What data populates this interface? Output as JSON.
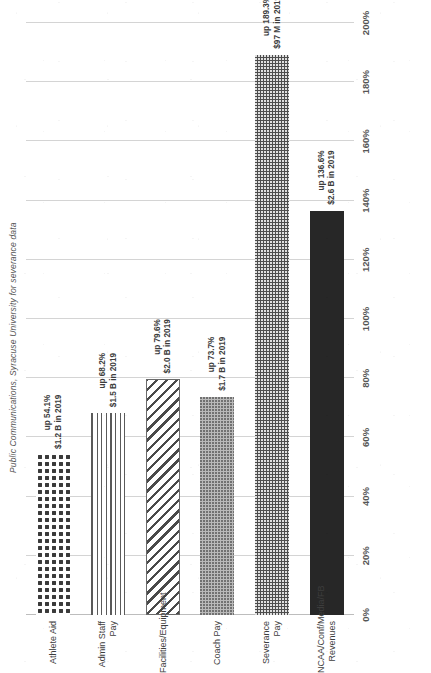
{
  "document": {
    "orientation": "rotated-90-ccw",
    "page_background": "#ffffff"
  },
  "chart_data": {
    "type": "bar",
    "orientation": "horizontal",
    "title": "Public Communications, Syracuse University for severance data",
    "xlabel": "",
    "ylabel": "",
    "xlim": [
      0,
      200
    ],
    "grid": true,
    "legend": false,
    "tick_suffix": "%",
    "ticks": [
      "0%",
      "20%",
      "40%",
      "60%",
      "80%",
      "100%",
      "120%",
      "140%",
      "160%",
      "180%",
      "200%"
    ],
    "tick_values": [
      0,
      20,
      40,
      60,
      80,
      100,
      120,
      140,
      160,
      180,
      200
    ],
    "categories": [
      "NCAA/Conf/Media/FB Revenues",
      "Severance Pay",
      "Coach Pay",
      "Facilities/Equipment",
      "Admin Staff Pay",
      "Athlete Aid"
    ],
    "values": [
      136.6,
      189.3,
      73.7,
      79.6,
      68.2,
      54.1
    ],
    "bars": [
      {
        "category_line1": "NCAA/Conf/Media/FB",
        "category_line2": "Revenues",
        "value": 136.6,
        "pct_label": "up 136.6%",
        "amount_label": "$2.6 B in 2019",
        "fill": "solid-black",
        "color": "#272727"
      },
      {
        "category_line1": "Severance Pay",
        "category_line2": "",
        "value": 189.3,
        "pct_label": "up 189.3%",
        "amount_label": "$97 M in 2019",
        "fill": "dense-dots-dark",
        "color": "#4d4d4d"
      },
      {
        "category_line1": "Coach Pay",
        "category_line2": "",
        "value": 73.7,
        "pct_label": "up 73.7%",
        "amount_label": "$1.7 B in 2019",
        "fill": "light-dots",
        "color": "#b9b9b9"
      },
      {
        "category_line1": "Facilities/Equipment",
        "category_line2": "",
        "value": 79.6,
        "pct_label": "up 79.6%",
        "amount_label": "$2.0 B in 2019",
        "fill": "diagonal-hatch",
        "color": "#4a4a4a"
      },
      {
        "category_line1": "Admin Staff Pay",
        "category_line2": "",
        "value": 68.2,
        "pct_label": "up 68.2%",
        "amount_label": "$1.5 B in 2019",
        "fill": "horizontal-lines",
        "color": "#5a5a5a"
      },
      {
        "category_line1": "Athlete Aid",
        "category_line2": "",
        "value": 54.1,
        "pct_label": "up 54.1%",
        "amount_label": "$1.2 B in 2019",
        "fill": "large-dots",
        "color": "#3a3a3a"
      }
    ]
  }
}
